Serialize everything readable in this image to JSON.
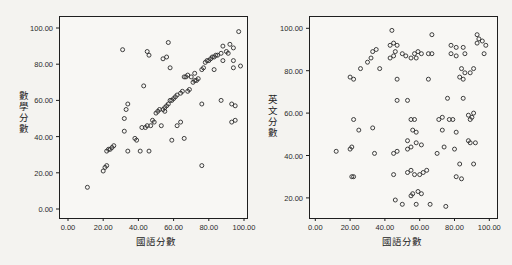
{
  "page": {
    "background": "#f4f3f0",
    "frame_color": "#1f1f1f",
    "marker_color": "#2b2b2b",
    "plot_fill": "#f8f7f4"
  },
  "chart_data": [
    {
      "type": "scatter",
      "title": "",
      "xlabel": "國語分數",
      "ylabel": "數學分數",
      "xlim": [
        -5,
        102
      ],
      "ylim": [
        -9,
        107
      ],
      "grid": false,
      "legend": "none",
      "marker": "hollow-circle",
      "x_ticks": [
        "0.00",
        "20.00",
        "40.00",
        "60.00",
        "80.00",
        "100.00"
      ],
      "x_tick_values": [
        0,
        20,
        40,
        60,
        80,
        100
      ],
      "y_ticks": [
        "0.00",
        "20.00",
        "40.00",
        "60.00",
        "80.00",
        "100.00"
      ],
      "y_tick_values": [
        0,
        20,
        40,
        60,
        80,
        100
      ],
      "points": [
        [
          11,
          12
        ],
        [
          20,
          21
        ],
        [
          21,
          23
        ],
        [
          22,
          24
        ],
        [
          22,
          32
        ],
        [
          23,
          33
        ],
        [
          24,
          33
        ],
        [
          25,
          34
        ],
        [
          26,
          35
        ],
        [
          32,
          43
        ],
        [
          34,
          32
        ],
        [
          41,
          32
        ],
        [
          46,
          32
        ],
        [
          38,
          39
        ],
        [
          39,
          38
        ],
        [
          42,
          45
        ],
        [
          44,
          45
        ],
        [
          45,
          46
        ],
        [
          47,
          46
        ],
        [
          32,
          50
        ],
        [
          33,
          55
        ],
        [
          34,
          58
        ],
        [
          43,
          68
        ],
        [
          31,
          88
        ],
        [
          45,
          87
        ],
        [
          46,
          85
        ],
        [
          54,
          83
        ],
        [
          56,
          84
        ],
        [
          57,
          92
        ],
        [
          48,
          49
        ],
        [
          49,
          48
        ],
        [
          50,
          53
        ],
        [
          51,
          54
        ],
        [
          52,
          55
        ],
        [
          54,
          55
        ],
        [
          55,
          54
        ],
        [
          55,
          56
        ],
        [
          56,
          57
        ],
        [
          57,
          58
        ],
        [
          58,
          60
        ],
        [
          59,
          60
        ],
        [
          60,
          61
        ],
        [
          61,
          62
        ],
        [
          62,
          63
        ],
        [
          64,
          64
        ],
        [
          65,
          65
        ],
        [
          66,
          73
        ],
        [
          67,
          73
        ],
        [
          68,
          74
        ],
        [
          70,
          73
        ],
        [
          68,
          65
        ],
        [
          69,
          66
        ],
        [
          71,
          70
        ],
        [
          72,
          71
        ],
        [
          73,
          71
        ],
        [
          74,
          72
        ],
        [
          72,
          75
        ],
        [
          76,
          77
        ],
        [
          77,
          78
        ],
        [
          78,
          81
        ],
        [
          79,
          82
        ],
        [
          80,
          82
        ],
        [
          81,
          83
        ],
        [
          82,
          84
        ],
        [
          83,
          84
        ],
        [
          84,
          85
        ],
        [
          58,
          78
        ],
        [
          76,
          58
        ],
        [
          85,
          85
        ],
        [
          87,
          86
        ],
        [
          88,
          90
        ],
        [
          90,
          87
        ],
        [
          92,
          91
        ],
        [
          94,
          89
        ],
        [
          91,
          86
        ],
        [
          88,
          82
        ],
        [
          94,
          82
        ],
        [
          83,
          77
        ],
        [
          94,
          78
        ],
        [
          98,
          79
        ],
        [
          87,
          60
        ],
        [
          93,
          58
        ],
        [
          95,
          57
        ],
        [
          97,
          98
        ],
        [
          53,
          46
        ],
        [
          62,
          46
        ],
        [
          64,
          48
        ],
        [
          59,
          38
        ],
        [
          66,
          39
        ],
        [
          76,
          24
        ],
        [
          93,
          48
        ],
        [
          95,
          49
        ]
      ]
    },
    {
      "type": "scatter",
      "title": "",
      "xlabel": "國語分數",
      "ylabel": "英文分數",
      "xlim": [
        -4,
        104
      ],
      "ylim": [
        10,
        108
      ],
      "grid": false,
      "legend": "none",
      "marker": "hollow-circle",
      "x_ticks": [
        "0.00",
        "20.00",
        "40.00",
        "60.00",
        "80.00",
        "100.00"
      ],
      "x_tick_values": [
        0,
        20,
        40,
        60,
        80,
        100
      ],
      "y_ticks": [
        "20.00",
        "40.00",
        "60.00",
        "80.00",
        "100.00"
      ],
      "y_tick_values": [
        20,
        40,
        60,
        80,
        100
      ],
      "points": [
        [
          44,
          99
        ],
        [
          67,
          97
        ],
        [
          93,
          97
        ],
        [
          94,
          95
        ],
        [
          93,
          93
        ],
        [
          96,
          94
        ],
        [
          98,
          92
        ],
        [
          97,
          88
        ],
        [
          43,
          92
        ],
        [
          45,
          93
        ],
        [
          47,
          92
        ],
        [
          46,
          89
        ],
        [
          33,
          89
        ],
        [
          35,
          90
        ],
        [
          32,
          86
        ],
        [
          30,
          84
        ],
        [
          43,
          86
        ],
        [
          45,
          87
        ],
        [
          50,
          88
        ],
        [
          52,
          87
        ],
        [
          57,
          88
        ],
        [
          59,
          89
        ],
        [
          61,
          88
        ],
        [
          55,
          86
        ],
        [
          58,
          86
        ],
        [
          65,
          88
        ],
        [
          67,
          88
        ],
        [
          78,
          92
        ],
        [
          81,
          91
        ],
        [
          85,
          91
        ],
        [
          78,
          88
        ],
        [
          81,
          87
        ],
        [
          86,
          88
        ],
        [
          37,
          81
        ],
        [
          26,
          81
        ],
        [
          20,
          77
        ],
        [
          22,
          76
        ],
        [
          47,
          76
        ],
        [
          65,
          76
        ],
        [
          83,
          77
        ],
        [
          85,
          76
        ],
        [
          84,
          81
        ],
        [
          86,
          79
        ],
        [
          89,
          79
        ],
        [
          91,
          81
        ],
        [
          47,
          66
        ],
        [
          53,
          66
        ],
        [
          76,
          67
        ],
        [
          85,
          67
        ],
        [
          88,
          59
        ],
        [
          89,
          57
        ],
        [
          90,
          58
        ],
        [
          91,
          60
        ],
        [
          55,
          57
        ],
        [
          57,
          57
        ],
        [
          71,
          57
        ],
        [
          73,
          58
        ],
        [
          77,
          57
        ],
        [
          79,
          57
        ],
        [
          22,
          57
        ],
        [
          25,
          52
        ],
        [
          33,
          53
        ],
        [
          56,
          52
        ],
        [
          58,
          51
        ],
        [
          73,
          52
        ],
        [
          81,
          51
        ],
        [
          12,
          42
        ],
        [
          20,
          43
        ],
        [
          21,
          44
        ],
        [
          34,
          41
        ],
        [
          45,
          41
        ],
        [
          47,
          42
        ],
        [
          53,
          43
        ],
        [
          55,
          44
        ],
        [
          58,
          46
        ],
        [
          61,
          45
        ],
        [
          53,
          47
        ],
        [
          70,
          41
        ],
        [
          74,
          44
        ],
        [
          80,
          43
        ],
        [
          88,
          47
        ],
        [
          89,
          46
        ],
        [
          92,
          46
        ],
        [
          83,
          36
        ],
        [
          91,
          36
        ],
        [
          45,
          31
        ],
        [
          21,
          30
        ],
        [
          22,
          30
        ],
        [
          53,
          32
        ],
        [
          55,
          33
        ],
        [
          57,
          31
        ],
        [
          60,
          31
        ],
        [
          62,
          32
        ],
        [
          64,
          33
        ],
        [
          81,
          30
        ],
        [
          84,
          29
        ],
        [
          46,
          19
        ],
        [
          50,
          17
        ],
        [
          55,
          21
        ],
        [
          56,
          22
        ],
        [
          59,
          23
        ],
        [
          61,
          22
        ],
        [
          58,
          17
        ],
        [
          66,
          17
        ],
        [
          75,
          16
        ]
      ]
    }
  ]
}
